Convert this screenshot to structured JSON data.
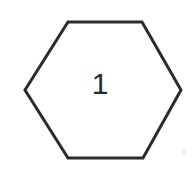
{
  "canvas": {
    "width": 196,
    "height": 174,
    "background_color": "#ffffff",
    "description": "hexagon-with-number"
  },
  "figure": {
    "name": "hexagon",
    "shape_type": "hexagon",
    "sides": 6,
    "orientation": "flat-top-pointy-side",
    "fill_color": "#ffffff",
    "stroke_color": "#2b2b2b",
    "stroke_width": 3,
    "points": "68,22 142,22 181,90 143,158 68,158 25,90",
    "vertices": [
      {
        "x": 68,
        "y": 22
      },
      {
        "x": 142,
        "y": 22
      },
      {
        "x": 181,
        "y": 90
      },
      {
        "x": 143,
        "y": 158
      },
      {
        "x": 68,
        "y": 158
      },
      {
        "x": 25,
        "y": 90
      }
    ],
    "label": {
      "text": "1",
      "color": "#2b2b2b",
      "font_size": 30,
      "center_x": 100,
      "center_y": 86
    }
  },
  "artifact": {
    "name": "scan-speck",
    "color": "#f2f2f2",
    "x": 184,
    "y": 152,
    "radius": 3
  }
}
